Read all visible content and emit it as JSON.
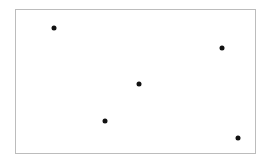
{
  "canvas": {
    "width": 269,
    "height": 160,
    "background": "#ffffff"
  },
  "frame": {
    "left": 15,
    "top": 9,
    "width": 241,
    "height": 145,
    "border_color": "#bcbcbc"
  },
  "points": [
    {
      "id": 1,
      "x": 54,
      "y": 28,
      "color": "#111111"
    },
    {
      "id": 2,
      "x": 222,
      "y": 48,
      "color": "#111111"
    },
    {
      "id": 3,
      "x": 139,
      "y": 84,
      "color": "#111111"
    },
    {
      "id": 4,
      "x": 105,
      "y": 121,
      "color": "#111111"
    },
    {
      "id": 5,
      "x": 238,
      "y": 138,
      "color": "#111111"
    }
  ]
}
